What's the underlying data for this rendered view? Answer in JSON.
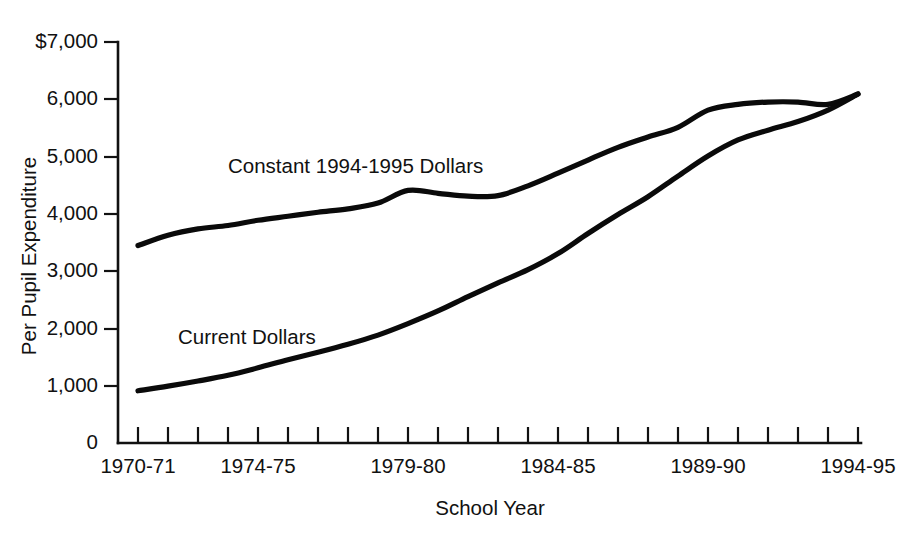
{
  "chart_data": {
    "type": "line",
    "title": "",
    "xlabel": "School Year",
    "ylabel": "Per Pupil Expenditure",
    "ylim": [
      0,
      7000
    ],
    "grid": false,
    "legend_position": "inline-labels",
    "y_ticks": [
      {
        "value": 0,
        "label": "0"
      },
      {
        "value": 1000,
        "label": "1,000"
      },
      {
        "value": 2000,
        "label": "2,000"
      },
      {
        "value": 3000,
        "label": "3,000"
      },
      {
        "value": 4000,
        "label": "4,000"
      },
      {
        "value": 5000,
        "label": "5,000"
      },
      {
        "value": 6000,
        "label": "6,000"
      },
      {
        "value": 7000,
        "label": "$7,000"
      }
    ],
    "categories": [
      "1970-71",
      "1971-72",
      "1972-73",
      "1973-74",
      "1974-75",
      "1975-76",
      "1976-77",
      "1977-78",
      "1978-79",
      "1979-80",
      "1980-81",
      "1981-82",
      "1982-83",
      "1983-84",
      "1984-85",
      "1985-86",
      "1986-87",
      "1987-88",
      "1988-89",
      "1989-90",
      "1990-91",
      "1991-92",
      "1992-93",
      "1993-94",
      "1994-95"
    ],
    "x_tick_labels_shown": [
      "1970-71",
      "1974-75",
      "1979-80",
      "1984-85",
      "1989-90",
      "1994-95"
    ],
    "series": [
      {
        "name": "Constant 1994-1995 Dollars",
        "label_text": "Constant 1994-1995 Dollars",
        "values": [
          3440,
          3620,
          3730,
          3790,
          3880,
          3950,
          4020,
          4080,
          4180,
          4400,
          4350,
          4300,
          4310,
          4480,
          4700,
          4930,
          5150,
          5330,
          5500,
          5800,
          5900,
          5940,
          5940,
          5900,
          6080
        ]
      },
      {
        "name": "Current Dollars",
        "label_text": "Current Dollars",
        "values": [
          910,
          990,
          1080,
          1180,
          1310,
          1450,
          1580,
          1720,
          1880,
          2080,
          2300,
          2550,
          2790,
          3020,
          3300,
          3650,
          3980,
          4290,
          4650,
          5000,
          5280,
          5450,
          5600,
          5800,
          6080
        ]
      }
    ],
    "annotations": [
      {
        "name": "constant-series-label",
        "text": "Constant 1994-1995 Dollars",
        "x": 228,
        "y": 173
      },
      {
        "name": "current-series-label",
        "text": "Current Dollars",
        "x": 178,
        "y": 344
      }
    ],
    "colors": {
      "line": "#0a0a0a",
      "axis": "#111111",
      "background": "#ffffff"
    }
  }
}
